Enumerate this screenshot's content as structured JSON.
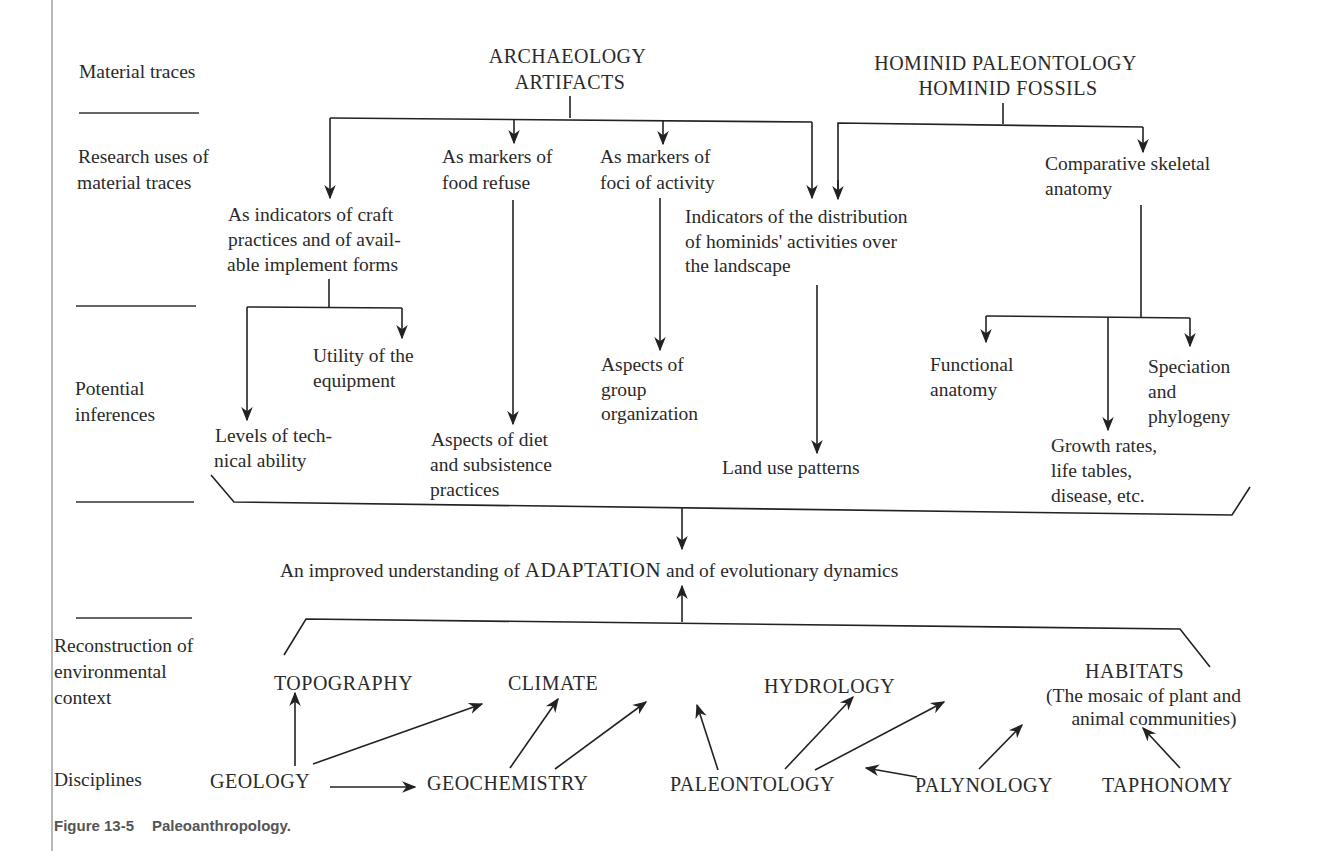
{
  "row_labels": {
    "material_traces": "Material traces",
    "research_uses": [
      "Research uses of",
      "material traces"
    ],
    "potential_inferences": [
      "Potential",
      "inferences"
    ],
    "reconstruction": [
      "Reconstruction of",
      "environmental",
      "context"
    ],
    "disciplines": "Disciplines"
  },
  "sources": {
    "archaeology": [
      "ARCHAEOLOGY",
      "ARTIFACTS"
    ],
    "hominid": [
      "HOMINID PALEONTOLOGY",
      "HOMINID FOSSILS"
    ]
  },
  "research_uses": {
    "craft": [
      "As indicators of craft",
      "practices and of avail-",
      "able implement forms"
    ],
    "food": [
      "As markers of",
      "food refuse"
    ],
    "foci": [
      "As markers of",
      "foci of activity"
    ],
    "distribution": [
      "Indicators of the distribution",
      "of hominids' activities over",
      "the landscape"
    ],
    "skeletal": [
      "Comparative skeletal",
      "anatomy"
    ]
  },
  "inferences": {
    "utility": [
      "Utility of the",
      "equipment"
    ],
    "technical": [
      "Levels of tech-",
      "nical ability"
    ],
    "diet": [
      "Aspects of diet",
      "and subsistence",
      "practices"
    ],
    "group": [
      "Aspects of",
      "group",
      "organization"
    ],
    "land_use": "Land use patterns",
    "functional": [
      "Functional",
      "anatomy"
    ],
    "speciation": [
      "Speciation",
      "and",
      "phylogeny"
    ],
    "growth": [
      "Growth rates,",
      "life tables,",
      "disease, etc."
    ]
  },
  "adaptation": {
    "prefix": "An improved understanding of",
    "keyword": "ADAPTATION",
    "suffix": "and of evolutionary dynamics"
  },
  "environment": {
    "topography": "TOPOGRAPHY",
    "climate": "CLIMATE",
    "hydrology": "HYDROLOGY",
    "habitats": [
      "HABITATS",
      "(The mosaic of plant and",
      "animal communities)"
    ]
  },
  "disciplines": {
    "geology": "GEOLOGY",
    "geochemistry": "GEOCHEMISTRY",
    "paleontology": "PALEONTOLOGY",
    "palynology": "PALYNOLOGY",
    "taphonomy": "TAPHONOMY"
  },
  "caption": {
    "number": "Figure 13-5",
    "title": "Paleoanthropology."
  }
}
